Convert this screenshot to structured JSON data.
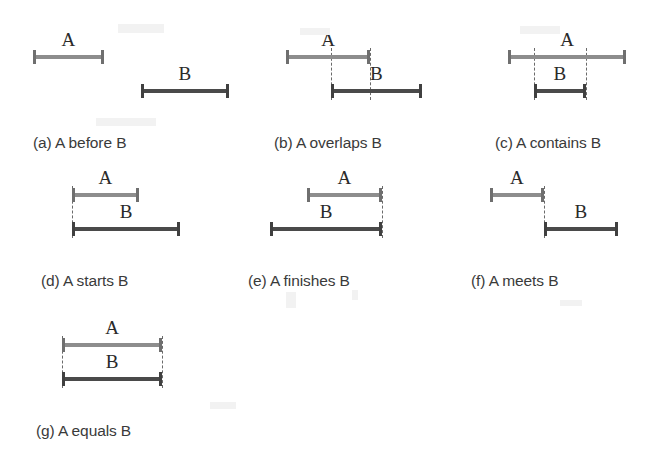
{
  "figure": {
    "background_color": "#ffffff",
    "interval_a_color": "#8d8d8d",
    "interval_b_color": "#4a4a4a",
    "guide_color": "#6a6a6a",
    "caption_color": "#3a3a3a",
    "label_a": "A",
    "label_b": "B"
  },
  "chart_data": {
    "type": "diagram",
    "title": "",
    "subtitle": "",
    "xlabel": "",
    "ylabel": "",
    "axis": "time (left to right)",
    "grid": false,
    "legend": "none",
    "series": [
      {
        "name": "A",
        "color": "#8d8d8d",
        "style": "light gray I-beam"
      },
      {
        "name": "B",
        "color": "#4a4a4a",
        "style": "dark gray I-beam"
      }
    ],
    "panels": [
      {
        "id": "a",
        "caption": "(a) A before B",
        "relation": "before",
        "a_start": 0.0,
        "a_end": 0.36,
        "b_start": 0.55,
        "b_end": 1.0,
        "guides": []
      },
      {
        "id": "b",
        "caption": "(b) A overlaps B",
        "relation": "overlaps",
        "a_start": 0.0,
        "a_end": 0.62,
        "b_start": 0.33,
        "b_end": 1.0,
        "guides": [
          0.33,
          0.62
        ]
      },
      {
        "id": "c",
        "caption": "(c) A contains B",
        "relation": "contains",
        "a_start": 0.0,
        "a_end": 1.0,
        "b_start": 0.22,
        "b_end": 0.66,
        "guides": [
          0.22,
          0.66
        ]
      },
      {
        "id": "d",
        "caption": "(d) A starts B",
        "relation": "starts",
        "a_start": 0.0,
        "a_end": 0.62,
        "b_start": 0.0,
        "b_end": 1.0,
        "guides": [
          0.0
        ]
      },
      {
        "id": "e",
        "caption": "(e) A finishes B",
        "relation": "finishes",
        "a_start": 0.33,
        "a_end": 1.0,
        "b_start": 0.0,
        "b_end": 1.0,
        "guides": [
          1.0
        ]
      },
      {
        "id": "f",
        "caption": "(f) A meets B",
        "relation": "meets",
        "a_start": 0.0,
        "a_end": 0.42,
        "b_start": 0.42,
        "b_end": 1.0,
        "guides": [
          0.42
        ]
      },
      {
        "id": "g",
        "caption": "(g) A equals B",
        "relation": "equals",
        "a_start": 0.0,
        "a_end": 1.0,
        "b_start": 0.0,
        "b_end": 1.0,
        "guides": [
          0.0,
          1.0
        ]
      }
    ]
  },
  "layout": {
    "panels": [
      {
        "id": "a",
        "left": 33,
        "top": 30,
        "width": 196,
        "track_width": 196,
        "caption_left": 0,
        "caption_top": 104
      },
      {
        "id": "b",
        "left": 286,
        "top": 30,
        "width": 136,
        "track_width": 136,
        "caption_left": -12,
        "caption_top": 104
      },
      {
        "id": "c",
        "left": 508,
        "top": 30,
        "width": 118,
        "track_width": 118,
        "caption_left": -13,
        "caption_top": 104
      },
      {
        "id": "d",
        "left": 72,
        "top": 168,
        "width": 108,
        "track_width": 108,
        "caption_left": -31,
        "caption_top": 104
      },
      {
        "id": "e",
        "left": 270,
        "top": 168,
        "width": 112,
        "track_width": 112,
        "caption_left": -22,
        "caption_top": 104
      },
      {
        "id": "f",
        "left": 490,
        "top": 168,
        "width": 128,
        "track_width": 128,
        "caption_left": -19,
        "caption_top": 104
      },
      {
        "id": "g",
        "left": 62,
        "top": 318,
        "width": 100,
        "track_width": 100,
        "caption_left": -26,
        "caption_top": 104
      }
    ],
    "row_a_y": 30,
    "row_b_y": 62
  }
}
